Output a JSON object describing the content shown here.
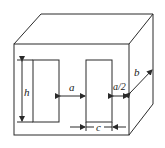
{
  "diagram": {
    "title": "",
    "type": "core-dimensions-isometric",
    "labels": {
      "height": "h",
      "window_gap": "a",
      "side_leg": "a/2",
      "depth": "b",
      "window_width": "c"
    },
    "colors": {
      "line": "#2a2a2a",
      "background": "#ffffff",
      "text": "#1a1a1a"
    }
  }
}
